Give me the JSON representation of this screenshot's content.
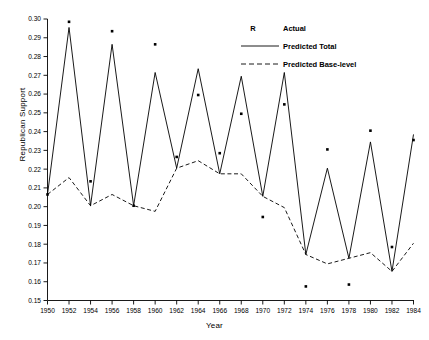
{
  "chart_data": {
    "type": "line",
    "title": "",
    "xlabel": "Year",
    "ylabel": "Republican Support",
    "xlim": [
      1950,
      1984
    ],
    "ylim": [
      0.15,
      0.3
    ],
    "grid": false,
    "legend_position": "top-right",
    "x_ticks": [
      1950,
      1952,
      1954,
      1956,
      1958,
      1960,
      1962,
      1964,
      1966,
      1968,
      1970,
      1972,
      1974,
      1976,
      1978,
      1980,
      1982,
      1984
    ],
    "x_tick_labels": [
      "1950",
      "1952",
      "1954",
      "1956",
      "1958",
      "1960",
      "1962",
      "1964",
      "1966",
      "1968",
      "1970",
      "1972",
      "1974",
      "1976",
      "1978",
      "1980",
      "1982",
      "1984"
    ],
    "y_ticks": [
      0.15,
      0.16,
      0.17,
      0.18,
      0.19,
      0.2,
      0.21,
      0.22,
      0.23,
      0.24,
      0.25,
      0.26,
      0.27,
      0.28,
      0.29,
      0.3
    ],
    "y_tick_labels": [
      "0.15",
      "0.16",
      "0.17",
      "0.18",
      "0.19",
      "0.20",
      "0.21",
      "0.22",
      "0.23",
      "0.24",
      "0.25",
      "0.26",
      "0.27",
      "0.28",
      "0.29",
      "0.30"
    ],
    "x": [
      1950,
      1952,
      1954,
      1956,
      1958,
      1960,
      1962,
      1964,
      1966,
      1968,
      1970,
      1972,
      1974,
      1976,
      1978,
      1980,
      1982,
      1984
    ],
    "series": [
      {
        "name": "Predicted Total",
        "style": "solid",
        "color": "#000000",
        "values": [
          0.2065,
          0.2955,
          0.2005,
          0.2865,
          0.2005,
          0.2715,
          0.2205,
          0.2735,
          0.2175,
          0.2695,
          0.2055,
          0.2715,
          0.1745,
          0.2205,
          0.1725,
          0.2345,
          0.1655,
          0.2385
        ]
      },
      {
        "name": "Predicted Base-level",
        "style": "dashed",
        "color": "#000000",
        "values": [
          0.2065,
          0.2155,
          0.2005,
          0.2065,
          0.2005,
          0.1975,
          0.2205,
          0.2245,
          0.2175,
          0.2175,
          0.2055,
          0.1995,
          0.1745,
          0.1695,
          0.1725,
          0.1755,
          0.1655,
          0.1805
        ]
      },
      {
        "name": "Actual",
        "style": "markers",
        "marker": "R",
        "color": "#000000",
        "values": [
          0.2065,
          0.2985,
          0.2135,
          0.2935,
          0.2005,
          0.2865,
          0.2265,
          0.2595,
          0.2285,
          0.2495,
          0.1945,
          0.2545,
          0.1575,
          0.2305,
          0.1585,
          0.2405,
          0.1785,
          0.2355
        ]
      }
    ],
    "legend": [
      {
        "key": "R",
        "label": "Actual",
        "style": "marker"
      },
      {
        "key": "",
        "label": "Predicted  Total",
        "style": "solid"
      },
      {
        "key": "",
        "label": "Predicted  Base-level",
        "style": "dashed"
      }
    ]
  },
  "axes": {
    "y_title": "Republican Support",
    "x_title": "Year"
  }
}
